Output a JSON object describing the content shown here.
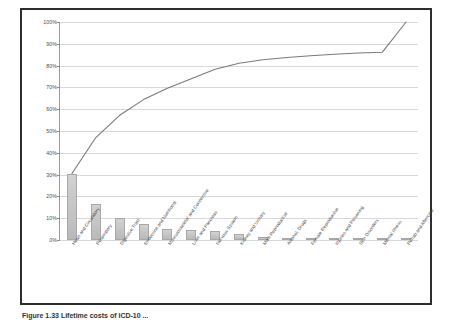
{
  "figure": {
    "caption": "Figure 1.33   Lifetime costs of ICD-10 ..."
  },
  "chart_data": {
    "type": "bar",
    "title": "",
    "xlabel": "",
    "ylabel": "",
    "ylim": [
      0,
      100
    ],
    "grid": true,
    "legend": "none",
    "yticks": [
      "0%",
      "10%",
      "20%",
      "30%",
      "40%",
      "50%",
      "60%",
      "70%",
      "80%",
      "90%",
      "100%"
    ],
    "ytick_values": [
      0,
      10,
      20,
      30,
      40,
      50,
      60,
      70,
      80,
      90,
      100
    ],
    "categories": [
      "Heart and Circulatory",
      "Respiratory",
      "Digestive Tract",
      "Endocrine and Nutritional",
      "Musculoskeletal and Connective",
      "Liver and Pancreas",
      "Nervous System",
      "Kidney and Urinary",
      "Male Reproductive",
      "Alcohol, Drugs",
      "Female Reproductive",
      "Injuries and Poisoning",
      "Skin Disorders",
      "Mental Illness",
      "Rehab and Aftercare"
    ],
    "series": [
      {
        "name": "Share of total",
        "type": "bar",
        "values": [
          30.5,
          16.5,
          10.2,
          7.2,
          5.2,
          4.4,
          4.3,
          2.8,
          1.6,
          1.0,
          0.8,
          0.7,
          0.6,
          0.3,
          0.2
        ]
      },
      {
        "name": "Cumulative",
        "type": "line",
        "color": "#7a7a7a",
        "values": [
          30.5,
          47.0,
          57.2,
          64.4,
          69.6,
          74.0,
          78.3,
          81.1,
          82.7,
          83.7,
          84.5,
          85.2,
          85.8,
          86.1,
          100.0
        ]
      }
    ]
  }
}
